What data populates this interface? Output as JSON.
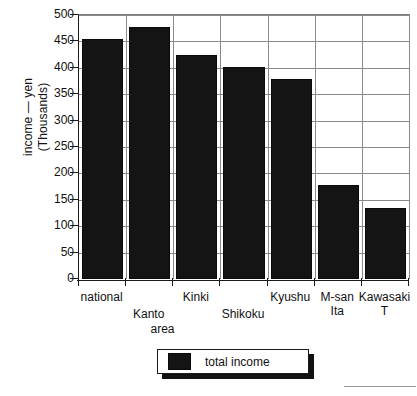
{
  "chart_data": {
    "type": "bar",
    "title": "",
    "categories": [
      "national",
      "Kanto",
      "Kinki",
      "Shikoku",
      "Kyushu",
      "M-san Ita",
      "Kawasaki T"
    ],
    "category_lines": [
      [
        "national"
      ],
      [
        "Kanto"
      ],
      [
        "Kinki"
      ],
      [
        "Shikoku"
      ],
      [
        "Kyushu"
      ],
      [
        "M-san",
        "Ita"
      ],
      [
        "Kawasaki",
        "T"
      ]
    ],
    "values": [
      455,
      477,
      425,
      402,
      378,
      178,
      134
    ],
    "series": [
      {
        "name": "total income",
        "values": [
          455,
          477,
          425,
          402,
          378,
          178,
          134
        ],
        "color": "#141414"
      }
    ],
    "xlabel": "area",
    "ylabel_line1": "income — yen",
    "ylabel_line2": "(Thousands)",
    "ylim": [
      0,
      500
    ],
    "ytick_step": 50,
    "yticks": [
      500,
      450,
      400,
      350,
      300,
      250,
      200,
      150,
      100,
      50,
      0
    ],
    "grid": {
      "horizontal": true,
      "vertical": true,
      "color": "#8a8a8a"
    },
    "legend": {
      "position": "bottom-center",
      "entries": [
        "total income"
      ]
    },
    "axis_color": "#1a1a1a",
    "background": "#ffffff"
  },
  "legend": {
    "label": "total income"
  },
  "axes": {
    "y_title_line1": "income — yen",
    "y_title_line2": "(Thousands)",
    "x_title": "area"
  }
}
